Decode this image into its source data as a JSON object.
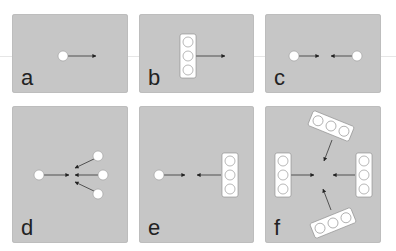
{
  "figure": {
    "background": "#ffffff",
    "panel_color": "#c6c6c6",
    "particle_color": "#ffffff",
    "arrow_color": "#222222",
    "panels": [
      {
        "id": "a",
        "label": "a",
        "description": "single particle with one arrow pointing right"
      },
      {
        "id": "b",
        "label": "b",
        "description": "vertical rod of three particles with one arrow pointing right"
      },
      {
        "id": "c",
        "label": "c",
        "description": "two particles with arrows pointing toward each other"
      },
      {
        "id": "d",
        "label": "d",
        "description": "one particle on left pointing right; three particles on right converging arrows toward center"
      },
      {
        "id": "e",
        "label": "e",
        "description": "single particle on left and vertical rod of three particles on right, arrows pointing toward each other"
      },
      {
        "id": "f",
        "label": "f",
        "description": "four rods of three particles arranged around center, all arrows pointing inward"
      }
    ]
  }
}
